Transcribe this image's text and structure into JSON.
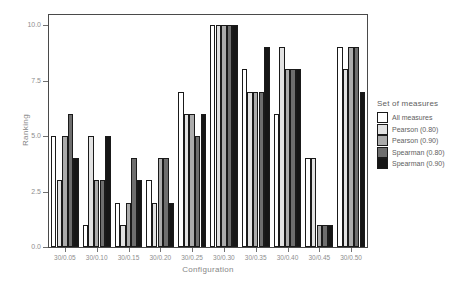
{
  "chart_data": {
    "type": "bar",
    "title": "",
    "xlabel": "Configuration",
    "ylabel": "Ranking",
    "ylim": [
      0,
      10.5
    ],
    "yticks": [
      0,
      2.5,
      5,
      7.5,
      10
    ],
    "ytick_labels": [
      "0.0",
      "2.5",
      "5.0",
      "7.5",
      "10.0"
    ],
    "grid": false,
    "legend_title": "Set of measures",
    "legend_position": "right",
    "categories": [
      "30/0.05",
      "30/0.10",
      "30/0.15",
      "30/0.20",
      "30/0.25",
      "30/0.30",
      "30/0.35",
      "30/0.40",
      "30/0.45",
      "30/0.50"
    ],
    "series": [
      {
        "name": "All measures",
        "color": "#FFFFFF",
        "values": [
          5,
          1,
          2,
          3,
          7,
          10,
          8,
          6,
          4,
          9
        ]
      },
      {
        "name": "Pearson (0.80)",
        "color": "#E2E2E2",
        "values": [
          3,
          5,
          1,
          2,
          6,
          10,
          7,
          9,
          4,
          8
        ]
      },
      {
        "name": "Pearson (0.90)",
        "color": "#ABABAB",
        "values": [
          5,
          3,
          2,
          4,
          6,
          10,
          7,
          8,
          1,
          9
        ]
      },
      {
        "name": "Spearman (0.80)",
        "color": "#6E6E6E",
        "values": [
          6,
          3,
          4,
          4,
          5,
          10,
          7,
          8,
          1,
          9
        ]
      },
      {
        "name": "Spearman (0.90)",
        "color": "#161616",
        "values": [
          4,
          5,
          3,
          2,
          6,
          10,
          9,
          8,
          1,
          7
        ]
      }
    ],
    "bar_outline_color": "#1a1a1a"
  }
}
